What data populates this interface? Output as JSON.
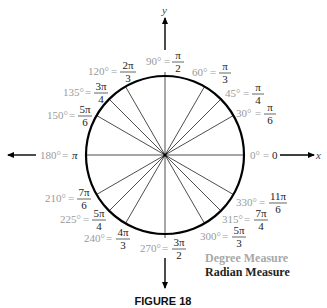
{
  "figure": {
    "caption": "FIGURE 18",
    "x_axis_label": "x",
    "y_axis_label": "y",
    "legend": {
      "degree": "Degree Measure",
      "radian": "Radian Measure"
    },
    "colors": {
      "degree_text": "#9a9a9a",
      "radian_text": "#222222",
      "circle": "#000000"
    },
    "angles": [
      {
        "deg": "0°",
        "rad_num": "0",
        "rad_den": ""
      },
      {
        "deg": "30°",
        "rad_num": "π",
        "rad_den": "6"
      },
      {
        "deg": "45°",
        "rad_num": "π",
        "rad_den": "4"
      },
      {
        "deg": "60°",
        "rad_num": "π",
        "rad_den": "3"
      },
      {
        "deg": "90°",
        "rad_num": "π",
        "rad_den": "2"
      },
      {
        "deg": "120°",
        "rad_num": "2π",
        "rad_den": "3"
      },
      {
        "deg": "135°",
        "rad_num": "3π",
        "rad_den": "4"
      },
      {
        "deg": "150°",
        "rad_num": "5π",
        "rad_den": "6"
      },
      {
        "deg": "180°",
        "rad_num": "π",
        "rad_den": ""
      },
      {
        "deg": "210°",
        "rad_num": "7π",
        "rad_den": "6"
      },
      {
        "deg": "225°",
        "rad_num": "5π",
        "rad_den": "4"
      },
      {
        "deg": "240°",
        "rad_num": "4π",
        "rad_den": "3"
      },
      {
        "deg": "270°",
        "rad_num": "3π",
        "rad_den": "2"
      },
      {
        "deg": "300°",
        "rad_num": "5π",
        "rad_den": "3"
      },
      {
        "deg": "315°",
        "rad_num": "7π",
        "rad_den": "4"
      },
      {
        "deg": "330°",
        "rad_num": "11π",
        "rad_den": "6"
      }
    ],
    "eq": "="
  }
}
